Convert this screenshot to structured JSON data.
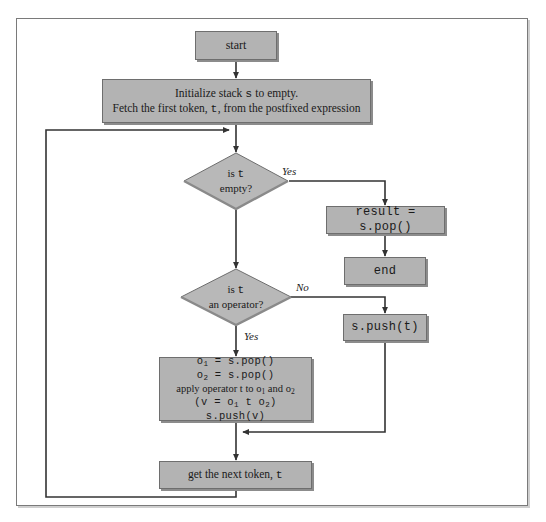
{
  "diagram": {
    "colors": {
      "node_fill": "#b3b3b3",
      "node_border": "#6e6e6e",
      "node_shadow": "#8c8c8c",
      "diamond_fill": "#b8b8b8",
      "connector": "#333333",
      "frame_border": "#7a7a7a",
      "background": "#ffffff"
    },
    "nodes": {
      "start": {
        "label": "start"
      },
      "initialize": {
        "line1_pre": "Initialize stack ",
        "line1_mono": "s",
        "line1_post": " to empty.",
        "line2_pre": "Fetch the first token, ",
        "line2_mono": "t",
        "line2_post": ", from the postfixed expression"
      },
      "is_empty": {
        "line1_pre": "is ",
        "line1_mono": "t",
        "line2": "empty?"
      },
      "result_pop": {
        "label": "result = s.pop()"
      },
      "end": {
        "label": "end"
      },
      "is_operator": {
        "line1_pre": "is ",
        "line1_mono": "t",
        "line2": "an operator?"
      },
      "push_token": {
        "label": "s.push(t)"
      },
      "apply_operator": {
        "line1_a": "o",
        "line1_sub": "1",
        "line1_b": " = s.pop()",
        "line2_a": "o",
        "line2_sub": "2",
        "line2_b": " = s.pop()",
        "line3_a": "apply operator t to o",
        "line3_sub1": "1",
        "line3_b": " and o",
        "line3_sub2": "2",
        "line4_a": "(v = o",
        "line4_sub1": "1",
        "line4_b": " t o",
        "line4_sub2": "2",
        "line4_c": ")",
        "line5": "s.push(v)"
      },
      "next_token": {
        "pre": "get the next token, ",
        "mono": "t"
      }
    },
    "edge_labels": {
      "empty_yes": "Yes",
      "operator_no": "No",
      "operator_yes": "Yes"
    }
  }
}
